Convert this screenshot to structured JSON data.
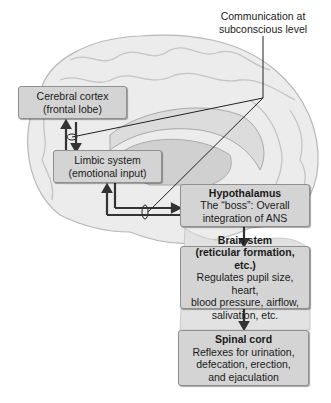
{
  "diagram": {
    "callout": {
      "line1": "Communication at",
      "line2": "subconscious level"
    },
    "boxes": {
      "cerebral_cortex": {
        "line1": "Cerebral cortex",
        "line2": "(frontal lobe)"
      },
      "limbic_system": {
        "line1": "Limbic system",
        "line2": "(emotional input)"
      },
      "hypothalamus": {
        "title": "Hypothalamus",
        "line1": "The “boss”: Overall",
        "line2": "integration of ANS"
      },
      "brain_stem": {
        "title": "Brain stem",
        "title2": "(reticular formation, etc.)",
        "line1": "Regulates pupil size, heart,",
        "line2": "blood pressure, airflow,",
        "line3": "salivation, etc."
      },
      "spinal_cord": {
        "title": "Spinal cord",
        "line1": "Reflexes for urination,",
        "line2": "defecation, erection,",
        "line3": "and ejaculation"
      }
    },
    "colors": {
      "box_fill": "#d4d4d4",
      "box_border": "#8f8f8f",
      "arrow": "#333333",
      "brain": "#e6e6e6"
    }
  }
}
